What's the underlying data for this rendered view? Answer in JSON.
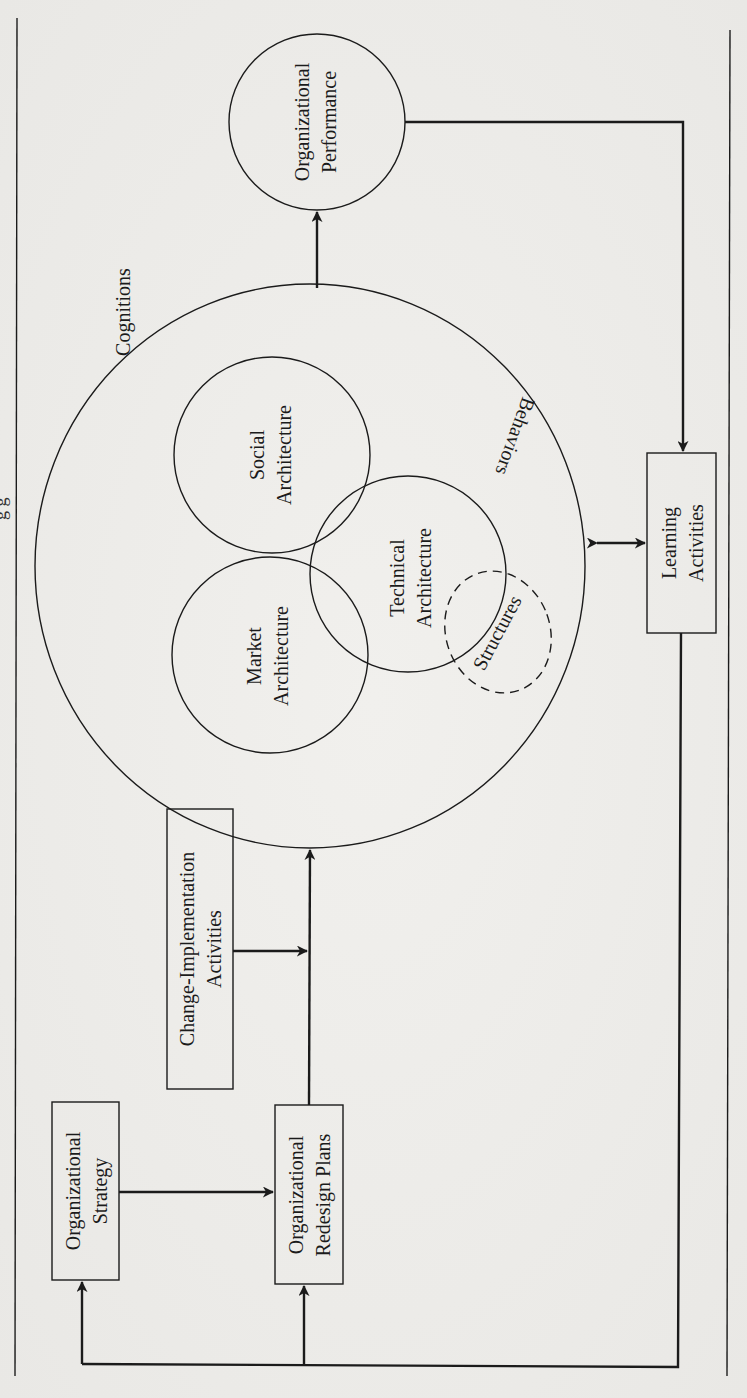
{
  "figure": {
    "orientation": "rotated-90-ccw",
    "top_fragment_text": "g   g",
    "nodes": {
      "performance": {
        "line1": "Organizational",
        "line2": "Performance",
        "shape": "circle"
      },
      "cognitions": {
        "label": "Cognitions",
        "shape": "ellipse"
      },
      "market": {
        "line1": "Market",
        "line2": "Architecture",
        "shape": "circle"
      },
      "social": {
        "line1": "Social",
        "line2": "Architecture",
        "shape": "circle"
      },
      "technical": {
        "line1": "Technical",
        "line2": "Architecture",
        "shape": "circle"
      },
      "behaviors": {
        "label": "Behaviors"
      },
      "structures": {
        "label": "Structures",
        "shape": "dashed-ellipse"
      },
      "learning": {
        "line1": "Learning",
        "line2": "Activities",
        "shape": "box"
      },
      "change": {
        "line1": "Change-Implementation",
        "line2": "Activities",
        "shape": "box"
      },
      "strategy": {
        "line1": "Organizational",
        "line2": "Strategy",
        "shape": "box"
      },
      "redesign": {
        "line1": "Organizational",
        "line2": "Redesign Plans",
        "shape": "box"
      }
    },
    "edges": [
      {
        "from": "architecture-ellipse",
        "to": "performance",
        "type": "arrow"
      },
      {
        "from": "performance",
        "to": "learning",
        "type": "arrow"
      },
      {
        "from": "architecture-ellipse",
        "to": "learning",
        "type": "double-arrow"
      },
      {
        "from": "learning",
        "to": "strategy",
        "type": "arrow"
      },
      {
        "from": "learning",
        "to": "redesign",
        "type": "arrow"
      },
      {
        "from": "strategy",
        "to": "redesign",
        "type": "arrow"
      },
      {
        "from": "change",
        "to": "redesign-line",
        "type": "arrow"
      },
      {
        "from": "redesign",
        "to": "architecture-ellipse",
        "type": "arrow"
      }
    ]
  },
  "colors": {
    "ink": "#1b1b1b",
    "paper": "#ecebe8"
  }
}
